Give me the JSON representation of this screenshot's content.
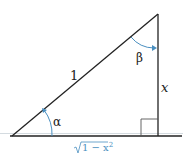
{
  "diagram": {
    "labels": {
      "hypotenuse": "1",
      "vertical_side": "x",
      "base_sqrt": "1 − x",
      "base_exponent": "2",
      "angle_bottom": "α",
      "angle_top": "β"
    },
    "colors": {
      "line": "#222222",
      "accent": "#4a8fc0",
      "guide": "#cfd6dc"
    }
  }
}
